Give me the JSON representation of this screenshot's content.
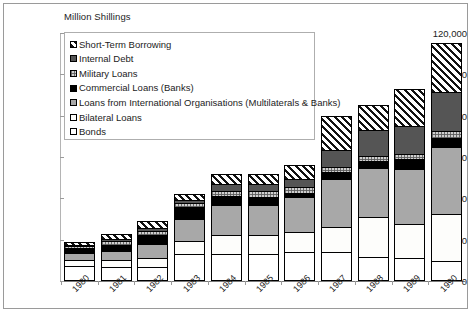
{
  "axis_title": "Million Shillings",
  "legend": {
    "items": [
      {
        "label": "Short-Term Borrowing",
        "key": "shortterm",
        "swatch": "hatch-diagonal-swatch"
      },
      {
        "label": "Internal Debt",
        "key": "internal",
        "swatch": "dark-gray-swatch"
      },
      {
        "label": "Military Loans",
        "key": "military",
        "swatch": "checkered-swatch"
      },
      {
        "label": "Commercial Loans (Banks)",
        "key": "commercial",
        "swatch": "black-swatch"
      },
      {
        "label": "Loans from International Organisations (Multilaterals & Banks)",
        "key": "intlorg",
        "swatch": "medium-gray-swatch"
      },
      {
        "label": "Bilateral Loans",
        "key": "bilateral",
        "swatch": "dotted-swatch"
      },
      {
        "label": "Bonds",
        "key": "bonds",
        "swatch": "white-swatch"
      }
    ]
  },
  "chart_data": {
    "type": "bar",
    "subtype": "stacked",
    "title": "",
    "xlabel": "",
    "ylabel": "Million Shillings",
    "ylim": [
      0,
      120000
    ],
    "ytick_labels": [
      "120,000",
      "100,000",
      "80,000",
      "60,000",
      "40,000",
      "20,000",
      "0"
    ],
    "ytick_values": [
      120000,
      100000,
      80000,
      60000,
      40000,
      20000,
      0
    ],
    "grid": false,
    "legend_position": "upper-left-inside",
    "categories": [
      "1980",
      "1981",
      "1982",
      "1983",
      "1984",
      "1985",
      "1986",
      "1987",
      "1988",
      "1989",
      "1990"
    ],
    "series": [
      {
        "name": "Bonds",
        "key": "bonds",
        "values": [
          7200,
          7000,
          7000,
          13300,
          13200,
          13300,
          13800,
          13800,
          11800,
          11200,
          9700
        ]
      },
      {
        "name": "Bilateral Loans",
        "key": "bilateral",
        "values": [
          2900,
          3400,
          4100,
          6200,
          9000,
          9000,
          9700,
          12200,
          19000,
          16500,
          22500
        ]
      },
      {
        "name": "Loans from International Organisations (Multilaterals & Banks)",
        "key": "intlorg",
        "values": [
          3300,
          4200,
          6900,
          10500,
          14500,
          14500,
          17000,
          23500,
          24000,
          26500,
          32500
        ]
      },
      {
        "name": "Commercial Loans (Banks)",
        "key": "commercial",
        "values": [
          2500,
          3000,
          4200,
          5600,
          4300,
          4100,
          2200,
          3200,
          3200,
          5000,
          4500
        ]
      },
      {
        "name": "Military Loans",
        "key": "military",
        "values": [
          1000,
          1700,
          2100,
          2100,
          2800,
          2700,
          2700,
          2500,
          2400,
          2200,
          3300
        ]
      },
      {
        "name": "Internal Debt",
        "key": "internal",
        "values": [
          700,
          900,
          1200,
          1300,
          3200,
          3200,
          4200,
          8000,
          12500,
          13500,
          19000
        ]
      },
      {
        "name": "Short-Term Borrowing",
        "key": "shortterm",
        "values": [
          1400,
          2800,
          3500,
          3000,
          5000,
          5200,
          6400,
          16800,
          12100,
          18100,
          23500
        ]
      }
    ],
    "totals": [
      19000,
      23000,
      29000,
      42000,
      52000,
      52000,
      56000,
      80000,
      85000,
      93000,
      115000
    ]
  }
}
